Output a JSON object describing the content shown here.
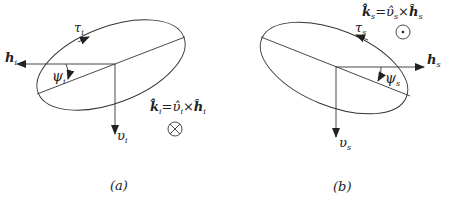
{
  "figure": {
    "panel_a": {
      "caption": "(a)",
      "labels": {
        "tau": "τ",
        "tau_sub": "i",
        "h": "h",
        "h_sub": "i",
        "psi": "ψ",
        "psi_sub": "i",
        "v": "υ",
        "v_sub": "i"
      },
      "formula": {
        "k": "k̂",
        "k_sub": "i",
        "eq": "=",
        "v": "υ̂",
        "v_sub": "i",
        "times": "×",
        "h": "ĥ",
        "h_sub": "i"
      },
      "direction_symbol": "into-page (⊗)"
    },
    "panel_b": {
      "caption": "(b)",
      "labels": {
        "tau": "τ",
        "tau_sub": "s",
        "h": "h",
        "h_sub": "s",
        "psi": "ψ",
        "psi_sub": "s",
        "v": "υ",
        "v_sub": "s"
      },
      "formula": {
        "k": "k̂",
        "k_sub": "s",
        "eq": "=",
        "v": "υ̂",
        "v_sub": "s",
        "times": "×",
        "h": "ĥ",
        "h_sub": "s"
      },
      "direction_symbol": "out-of-page (⊙)"
    },
    "colors": {
      "stroke": "#333333",
      "text": "#222222",
      "background": "#ffffff"
    }
  }
}
